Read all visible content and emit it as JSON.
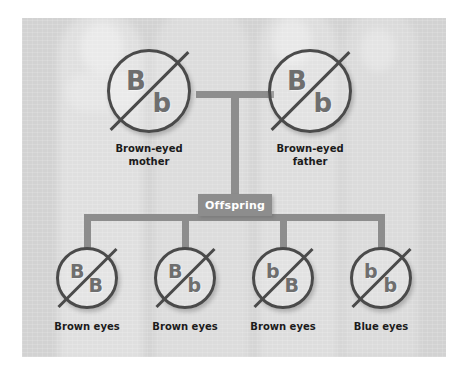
{
  "diagram": {
    "colors": {
      "panel_background": "#d2d2d2",
      "connector": "#8d8d8d",
      "circle_outline": "#4a4a4a",
      "allele_letter": "#6e6e6e",
      "caption_text": "#1b1b1b",
      "offspring_box_text": "#ffffff"
    },
    "parents": [
      {
        "id": "mother",
        "allele_top": "B",
        "allele_bottom": "b",
        "caption_line1": "Brown-eyed",
        "caption_line2": "mother"
      },
      {
        "id": "father",
        "allele_top": "B",
        "allele_bottom": "b",
        "caption_line1": "Brown-eyed",
        "caption_line2": "father"
      }
    ],
    "offspring_box_label": "Offspring",
    "offspring": [
      {
        "id": "child-1",
        "allele_top": "B",
        "allele_bottom": "B",
        "caption": "Brown eyes"
      },
      {
        "id": "child-2",
        "allele_top": "B",
        "allele_bottom": "b",
        "caption": "Brown eyes"
      },
      {
        "id": "child-3",
        "allele_top": "b",
        "allele_bottom": "B",
        "caption": "Brown eyes"
      },
      {
        "id": "child-4",
        "allele_top": "b",
        "allele_bottom": "b",
        "caption": "Blue eyes"
      }
    ]
  }
}
